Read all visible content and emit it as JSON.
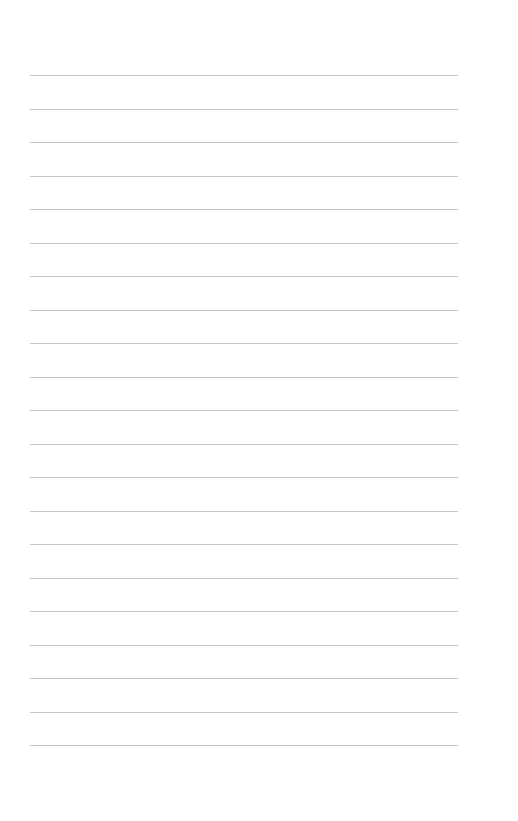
{
  "page": {
    "type": "blank-lined-sheet",
    "background_color": "#ffffff",
    "rule_color": "#c4c4c4",
    "rule_count": 21,
    "rule_left": 30,
    "rule_right": 458,
    "first_rule_y": 75,
    "rule_spacing": 33.5
  }
}
